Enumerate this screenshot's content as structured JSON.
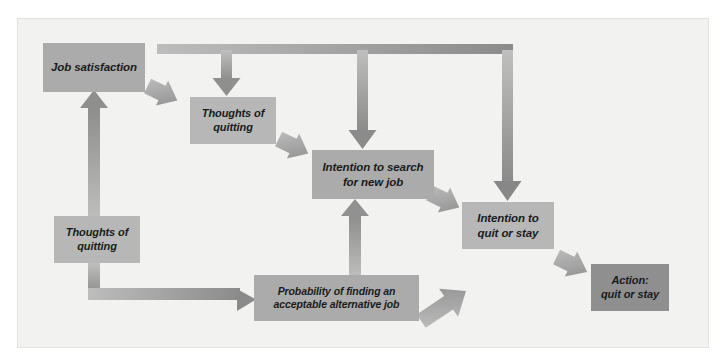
{
  "figure": {
    "background_color": "#f2f2f0",
    "page_color": "#ffffff",
    "box_fill_light": "#b7b7b7",
    "box_fill_mid": "#ababab",
    "box_fill_dark": "#8f8f8f",
    "arrow_fill": "#9a9a9a",
    "corner_mark": ""
  },
  "nodes": [
    {
      "id": "job-satisfaction",
      "label": "Job satisfaction",
      "line1": "Job satisfaction",
      "line2": "",
      "shade": "mid"
    },
    {
      "id": "thoughts-top",
      "label": "Thoughts of quitting",
      "line1": "Thoughts of",
      "line2": "quitting",
      "shade": "light"
    },
    {
      "id": "intention-search",
      "label": "Intention to search for new job",
      "line1": "Intention to search",
      "line2": "for new job",
      "shade": "mid"
    },
    {
      "id": "intention-quit",
      "label": "Intention to quit or stay",
      "line1": "Intention to",
      "line2": "quit or stay",
      "shade": "light"
    },
    {
      "id": "action",
      "label": "Action: quit or stay",
      "line1": "Action:",
      "line2": "quit or stay",
      "shade": "dark"
    },
    {
      "id": "thoughts-left",
      "label": "Thoughts of quitting",
      "line1": "Thoughts of",
      "line2": "quitting",
      "shade": "light"
    },
    {
      "id": "probability",
      "label": "Probability of finding an acceptable alternative job",
      "line1": "Probability of finding an",
      "line2": "acceptable alternative job",
      "shade": "mid"
    }
  ],
  "connectors": [
    {
      "id": "job-satisfaction-to-thoughts-top",
      "from": "job-satisfaction",
      "to": "thoughts-top",
      "kind": "diagonal-arrow"
    },
    {
      "id": "thoughts-top-to-intention-search",
      "from": "thoughts-top",
      "to": "intention-search",
      "kind": "diagonal-arrow"
    },
    {
      "id": "intention-search-to-intention-quit",
      "from": "intention-search",
      "to": "intention-quit",
      "kind": "diagonal-arrow"
    },
    {
      "id": "intention-quit-to-action",
      "from": "intention-quit",
      "to": "action",
      "kind": "diagonal-arrow"
    },
    {
      "id": "thoughts-left-to-job-satisfaction",
      "from": "thoughts-left",
      "to": "job-satisfaction",
      "kind": "vertical-arrow-up"
    },
    {
      "id": "thoughts-left-to-probability",
      "from": "thoughts-left",
      "to": "probability",
      "kind": "elbow-arrow-right"
    },
    {
      "id": "probability-to-intention-search",
      "from": "probability",
      "to": "intention-search",
      "kind": "vertical-arrow-up"
    },
    {
      "id": "probability-to-intention-quit",
      "from": "probability",
      "to": "intention-quit",
      "kind": "diagonal-arrow-up"
    },
    {
      "id": "feedback-bus-to-thoughts-top",
      "from": "job-satisfaction",
      "to": "thoughts-top",
      "kind": "bus-branch-down"
    },
    {
      "id": "feedback-bus-to-intention-search",
      "from": "job-satisfaction",
      "to": "intention-search",
      "kind": "bus-branch-down"
    },
    {
      "id": "feedback-bus-to-intention-quit",
      "from": "job-satisfaction",
      "to": "intention-quit",
      "kind": "bus-branch-down"
    }
  ]
}
